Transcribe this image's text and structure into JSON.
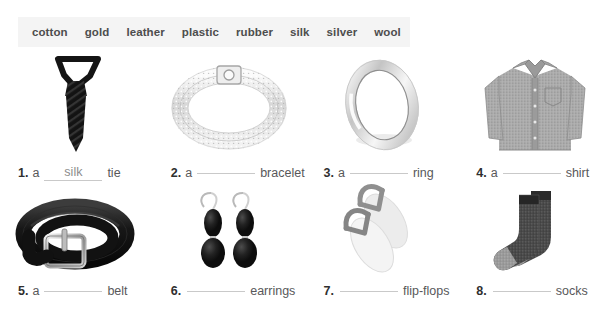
{
  "wordbank": {
    "words": [
      "cotton",
      "gold",
      "leather",
      "plastic",
      "rubber",
      "silk",
      "silver",
      "wool"
    ]
  },
  "colors": {
    "wordbank_bg": "#f4f4f4",
    "text": "#58585a",
    "number": "#2f2f2f",
    "blank_line": "#c9c9c9",
    "answer_text": "#8d8d8d"
  },
  "exercises": [
    {
      "number": "1.",
      "article": "a",
      "answer": "silk",
      "noun": "tie",
      "image": "black-striped-necktie"
    },
    {
      "number": "2.",
      "article": "a",
      "answer": "",
      "noun": "bracelet",
      "image": "silver-diamond-bracelet"
    },
    {
      "number": "3.",
      "article": "a",
      "answer": "",
      "noun": "ring",
      "image": "silver-band-ring"
    },
    {
      "number": "4.",
      "article": "a",
      "answer": "",
      "noun": "shirt",
      "image": "gray-button-down-shirt"
    },
    {
      "number": "5.",
      "article": "a",
      "answer": "",
      "noun": "belt",
      "image": "black-leather-belt"
    },
    {
      "number": "6.",
      "article": "",
      "answer": "",
      "noun": "earrings",
      "image": "black-drop-earrings"
    },
    {
      "number": "7.",
      "article": "",
      "answer": "",
      "noun": "flip-flops",
      "image": "gray-flip-flops"
    },
    {
      "number": "8.",
      "article": "",
      "answer": "",
      "noun": "socks",
      "image": "gray-wool-socks"
    }
  ]
}
